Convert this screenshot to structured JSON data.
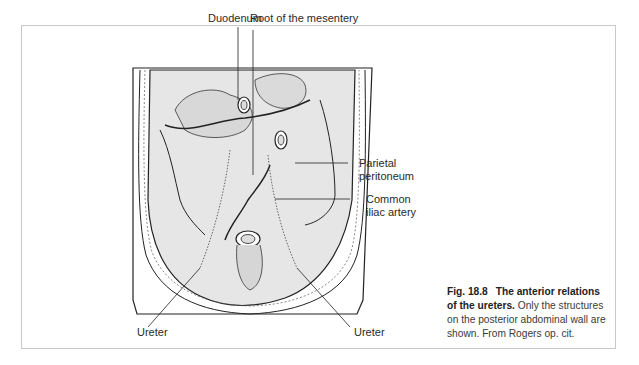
{
  "figure": {
    "number": "Fig. 18.8",
    "title": "The anterior relations of the ureters.",
    "description": "Only the structures on the posterior abdominal wall are shown.",
    "source": "From Rogers op. cit."
  },
  "labels": {
    "duodenum": "Duodenum",
    "root_mesentery": "Root of the mesentery",
    "parietal_line1": "Parietal",
    "parietal_line2": "peritoneum",
    "iliac_line1": "Common",
    "iliac_line2": "iliac artery",
    "ureter_left": "Ureter",
    "ureter_right": "Ureter"
  },
  "colors": {
    "frame_border": "#c9c9c9",
    "shading": "#e6e6e6",
    "line": "#222222"
  }
}
